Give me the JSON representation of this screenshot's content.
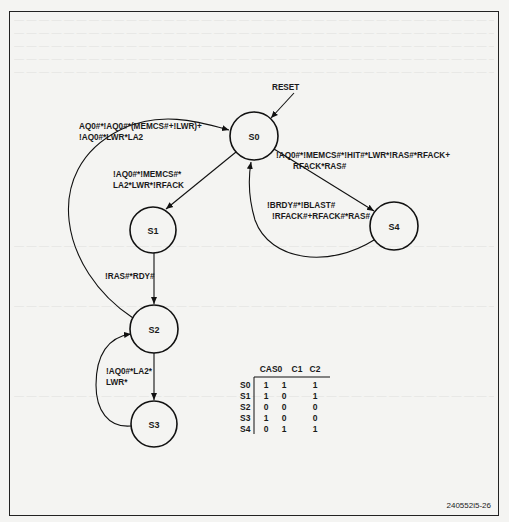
{
  "figure": {
    "id_label": "240552i5-26",
    "reset_label": "RESET",
    "states": [
      {
        "name": "S0",
        "cx": 254,
        "cy": 136,
        "r": 24
      },
      {
        "name": "S1",
        "cx": 153,
        "cy": 230,
        "r": 23
      },
      {
        "name": "S2",
        "cx": 154,
        "cy": 329,
        "r": 24
      },
      {
        "name": "S3",
        "cx": 154,
        "cy": 424,
        "r": 23
      },
      {
        "name": "S4",
        "cx": 394,
        "cy": 226,
        "r": 24
      }
    ],
    "transitions": {
      "s2_to_s0": [
        "AQ0#*!AQ0#*(MEMCS#+!LWR)+",
        "!AQ0#*LWR*LA2"
      ],
      "s0_to_s1": [
        "!AQ0#*!MEMCS#*",
        "LA2*LWR*!RFACK"
      ],
      "s0_to_s4": [
        "!AQ0#*!MEMCS#*!HIT#*LWR*!RAS#*RFACK+",
        "RFACK*RAS#"
      ],
      "s4_to_s0": [
        "!BRDY#*!BLAST#",
        "!RFACK#+RFACK#*RAS#"
      ],
      "s1_to_s2": [
        "!RAS#*RDY#"
      ],
      "s3_to_s2": [
        "!AQ0#*LA2*",
        "LWR*"
      ]
    },
    "output_table": {
      "headers": [
        "CAS0",
        "C1",
        "C2"
      ],
      "rows": [
        {
          "state": "S0",
          "values": [
            "1",
            "1",
            "1"
          ]
        },
        {
          "state": "S1",
          "values": [
            "1",
            "0",
            "1"
          ]
        },
        {
          "state": "S2",
          "values": [
            "0",
            "0",
            "0"
          ]
        },
        {
          "state": "S3",
          "values": [
            "1",
            "0",
            "0"
          ]
        },
        {
          "state": "S4",
          "values": [
            "0",
            "1",
            "1"
          ]
        }
      ]
    }
  }
}
